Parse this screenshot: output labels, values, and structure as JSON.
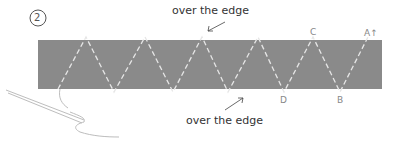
{
  "step": {
    "number": "2"
  },
  "labels": {
    "top": "over the edge",
    "bottom": "over the edge"
  },
  "points": {
    "A": "A↑",
    "B": "B",
    "C": "C",
    "D": "D"
  },
  "colors": {
    "strip": "#8a8a8a",
    "stitch": "#e6e6e6",
    "text": "#333333"
  }
}
